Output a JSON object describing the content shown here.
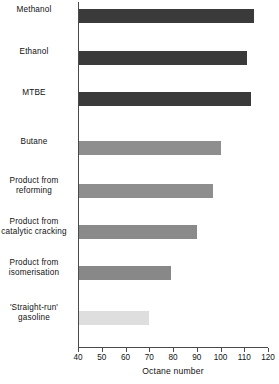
{
  "chart_data": {
    "type": "bar",
    "orientation": "horizontal",
    "title": "",
    "xlabel": "Octane number",
    "ylabel": "",
    "xlim": [
      40,
      120
    ],
    "xticks": [
      40,
      50,
      60,
      70,
      80,
      90,
      100,
      110,
      120
    ],
    "grid": false,
    "legend": null,
    "categories": [
      "Methanol",
      "Ethanol",
      "MTBE",
      "Butane",
      "Product from\nreforming",
      "Product from\ncatalytic cracking",
      "Product from\nisomerisation",
      "'Straight-run'\ngasoline"
    ],
    "values": [
      114,
      111,
      113,
      100,
      97,
      90,
      79,
      70
    ],
    "bar_colors": [
      "#3a3a3a",
      "#3a3a3a",
      "#3a3a3a",
      "#8e8e8e",
      "#8e8e8e",
      "#8a8a8a",
      "#888888",
      "#dedede"
    ],
    "bars": [
      {
        "label": "Methanol",
        "value": 114,
        "color": "#3a3a3a",
        "top": 9
      },
      {
        "label": "Ethanol",
        "value": 111,
        "color": "#3a3a3a",
        "top": 51
      },
      {
        "label": "MTBE",
        "value": 113,
        "color": "#3a3a3a",
        "top": 92
      },
      {
        "label": "Butane",
        "value": 100,
        "color": "#8e8e8e",
        "top": 141
      },
      {
        "label": "Product from reforming",
        "value": 97,
        "color": "#8e8e8e",
        "top": 184
      },
      {
        "label": "Product from catalytic cracking",
        "value": 90,
        "color": "#8a8a8a",
        "top": 225
      },
      {
        "label": "Product from isomerisation",
        "value": 79,
        "color": "#888888",
        "top": 266
      },
      {
        "label": "'Straight-run' gasoline",
        "value": 70,
        "color": "#dedede",
        "top": 311
      }
    ]
  },
  "axis": {
    "x_title": "Octane number",
    "tick_labels": [
      "40",
      "50",
      "60",
      "70",
      "80",
      "90",
      "100",
      "110",
      "120"
    ]
  },
  "labels": {
    "methanol": "Methanol",
    "ethanol": "Ethanol",
    "mtbe": "MTBE",
    "butane": "Butane",
    "reforming": "Product from\nreforming",
    "catalytic_cracking": "Product from\ncatalytic cracking",
    "isomerisation": "Product from\nisomerisation",
    "straight_run": "'Straight-run'\ngasoline"
  },
  "colors": {
    "bar_dark": "#3a3a3a",
    "bar_mid": "#8e8e8e",
    "bar_light": "#dedede",
    "axis": "#4a4a4a",
    "background": "#ffffff",
    "text": "#111111"
  }
}
